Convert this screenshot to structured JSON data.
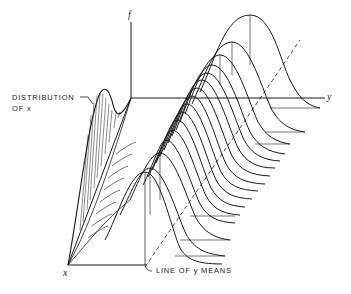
{
  "figure": {
    "type": "3d-regression-diagram",
    "axes": {
      "f": "f",
      "x": "x",
      "y": "y"
    },
    "annotations": {
      "distribution_of_x_line1": "DISTRIBUTION",
      "distribution_of_x_line2": "OF x",
      "line_of_y_means": "LINE OF y MEANS"
    },
    "stroke_color": "#1a1a1a",
    "background_color": "#ffffff",
    "curve_count": 16
  }
}
